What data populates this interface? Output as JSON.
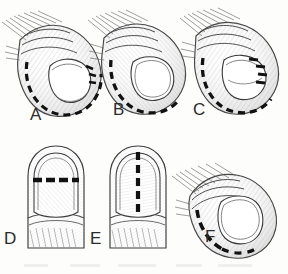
{
  "figure": {
    "background_color": "#fdfdfc",
    "ink_color": "#2b2b2b",
    "incision_color": "#111111",
    "shading_color": "#6f6f6f",
    "panel_count": 6,
    "labels": {
      "a": "A",
      "b": "B",
      "c": "C",
      "d": "D",
      "e": "E",
      "f": "F"
    },
    "panels": [
      {
        "id": "a",
        "label": "A",
        "view": "oblique-lateral fingertip",
        "row": "top",
        "column": 1,
        "incision_style": "dashed",
        "incision_description": "curved dashed incision following the distal and lateral nail fold margin",
        "nail_plate_visible": true,
        "marker_dashes": "lateral nail fold dashes"
      },
      {
        "id": "b",
        "label": "B",
        "view": "oblique-lateral fingertip",
        "row": "top",
        "column": 2,
        "incision_style": "dashed",
        "incision_description": "dashed incision along the distal hyponychial margin beneath the free edge",
        "nail_plate_visible": true,
        "marker_dashes": "distal margin dashes"
      },
      {
        "id": "c",
        "label": "C",
        "view": "oblique-lateral fingertip",
        "row": "top",
        "column": 3,
        "incision_style": "dashed",
        "incision_description": "dashed incision encircling the distal fingertip plus short dashes over the distal nail plate",
        "nail_plate_visible": true,
        "marker_dashes": "perionychial plus plate dashes"
      },
      {
        "id": "d",
        "label": "D",
        "view": "dorsal fingertip",
        "row": "bottom",
        "column": 1,
        "incision_style": "dashed",
        "incision_description": "transverse dashed line across the proximal nail plate at the lunula",
        "nail_plate_visible": true,
        "marker_dashes": "transverse dashes"
      },
      {
        "id": "e",
        "label": "E",
        "view": "dorsal fingertip",
        "row": "bottom",
        "column": 2,
        "incision_style": "dashed",
        "incision_description": "longitudinal midline dashed line running down the centre of the nail plate",
        "nail_plate_visible": true,
        "marker_dashes": "longitudinal midline dashes"
      },
      {
        "id": "f",
        "label": "F",
        "view": "oblique-lateral fingertip",
        "row": "bottom",
        "column": 3,
        "incision_style": "dashed",
        "incision_description": "dashed incision along the lateral nail fold running proximal to distal",
        "nail_plate_visible": true,
        "marker_dashes": "lateral fold dashes"
      }
    ]
  }
}
